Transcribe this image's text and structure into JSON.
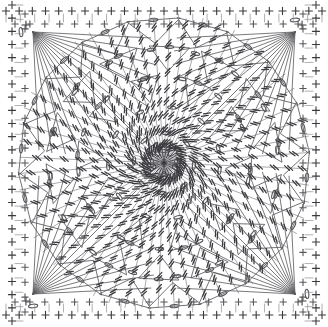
{
  "document": {
    "title": "Crochet Granny Square Chart",
    "kind": "crochet-stitch-diagram",
    "width": 328,
    "height": 327,
    "background_color": "#ffffff",
    "ink_color": "#58585c",
    "ink_color_dark": "#3a3a3e",
    "ink_color_light": "#8e8e93"
  },
  "chart_data": {
    "type": "diagram",
    "title": "Crochet Granny Square Stitch Chart",
    "xlabel": "",
    "ylabel": "",
    "grid": false,
    "legend_position": "none",
    "notation": "international crochet symbol chart",
    "shape": "square motif worked in the round from a central ring",
    "geometry": {
      "center_x": 164,
      "center_y": 163,
      "square_half_width": 158,
      "corner_fan_points": [
        {
          "x": 33,
          "y": 32
        },
        {
          "x": 295,
          "y": 32
        },
        {
          "x": 295,
          "y": 294
        },
        {
          "x": 33,
          "y": 294
        }
      ]
    },
    "symbols": [
      {
        "name": "chain",
        "glyph": "oval",
        "count_approx": 96,
        "description": "small elongated oval = chain stitch (ch)"
      },
      {
        "name": "single-crochet",
        "glyph": "cross",
        "count_approx": 112,
        "description": "plus / cross = single crochet (sc)"
      },
      {
        "name": "treble-crochet",
        "glyph": "stem-with-two-bars",
        "count_approx": 180,
        "description": "vertical stem with two slanted bars = treble crochet (tr)"
      },
      {
        "name": "double-crochet",
        "glyph": "stem-with-one-bar",
        "count_approx": 64,
        "description": "vertical stem with one slanted bar = double crochet (dc)"
      },
      {
        "name": "slip-stitch",
        "glyph": "dot",
        "count_approx": 24,
        "description": "filled dot = slip stitch (sl st)"
      }
    ],
    "rounds": [
      {
        "index": 1,
        "name": "center ring",
        "radius": 12,
        "spokes": 12,
        "stitch": "treble-crochet"
      },
      {
        "index": 2,
        "name": "inner rosette",
        "radius": 30,
        "spokes": 24,
        "stitch": "treble-crochet"
      },
      {
        "index": 3,
        "name": "mid ring",
        "radius": 56,
        "spokes": 32,
        "stitch": "treble-crochet"
      },
      {
        "index": 4,
        "name": "outer ring",
        "radius": 86,
        "spokes": 40,
        "stitch": "treble-crochet"
      },
      {
        "index": 5,
        "name": "fan ring",
        "radius": 114,
        "spokes": 48,
        "stitch": "treble-crochet"
      },
      {
        "index": 6,
        "name": "square border",
        "radius": 150,
        "spokes": 0,
        "stitch": "single-crochet"
      }
    ],
    "border": {
      "top_stitch_count": 24,
      "bottom_stitch_count": 24,
      "left_stitch_count": 24,
      "right_stitch_count": 24,
      "stitch": "single-crochet",
      "glyph": "cross"
    }
  }
}
